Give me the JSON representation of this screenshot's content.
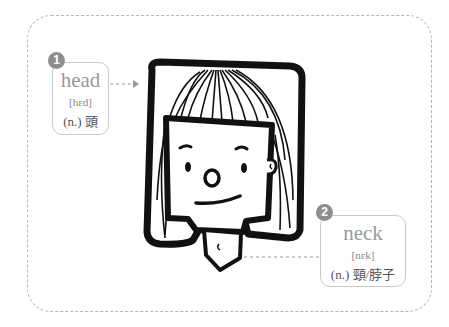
{
  "labels": [
    {
      "number": "1",
      "word": "head",
      "ipa": "[hɛd]",
      "definition": "(n.) 頭"
    },
    {
      "number": "2",
      "word": "neck",
      "ipa": "[nɛk]",
      "definition": "(n.) 頸/脖子"
    }
  ],
  "colors": {
    "badge": "#8e8e8e",
    "border": "#c8c8c8",
    "outline": "#111111"
  }
}
